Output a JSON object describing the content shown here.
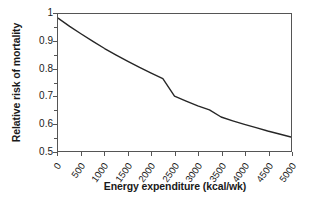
{
  "chart_data": {
    "type": "line",
    "title": "",
    "xlabel": "Energy expenditure (kcal/wk)",
    "ylabel": "Relative risk of mortality",
    "xlim": [
      0,
      5000
    ],
    "ylim": [
      0.5,
      1.0
    ],
    "grid": false,
    "legend": "none",
    "x_ticks": [
      "0",
      "500",
      "1000",
      "1500",
      "2000",
      "2500",
      "3000",
      "3500",
      "4000",
      "4500",
      "5000"
    ],
    "x_tick_values": [
      0,
      500,
      1000,
      1500,
      2000,
      2500,
      3000,
      3500,
      4000,
      4500,
      5000
    ],
    "y_ticks": [
      "1",
      "0.9",
      "0.8",
      "0.7",
      "0.6",
      "0.5"
    ],
    "y_tick_values": [
      1.0,
      0.9,
      0.8,
      0.7,
      0.6,
      0.5
    ],
    "y_minor_tick_values": [
      0.95,
      0.85,
      0.75,
      0.65,
      0.55
    ],
    "series": [
      {
        "name": "Relative risk of mortality",
        "color": "#262626",
        "line_width": 1.4,
        "x": [
          0,
          250,
          500,
          750,
          1000,
          1250,
          1500,
          1750,
          2000,
          2250,
          2500,
          2750,
          3000,
          3250,
          3500,
          3750,
          4000,
          4250,
          4500,
          4750,
          5000
        ],
        "values": [
          0.985,
          0.955,
          0.927,
          0.9,
          0.874,
          0.85,
          0.827,
          0.805,
          0.784,
          0.764,
          0.7,
          0.682,
          0.665,
          0.65,
          0.624,
          0.61,
          0.597,
          0.585,
          0.573,
          0.562,
          0.551
        ]
      }
    ]
  },
  "axes": {
    "x_title": "Energy expenditure (kcal/wk)",
    "y_title": "Relative risk of mortality"
  },
  "colors": {
    "curve": "#262626",
    "frame": "#555555",
    "text": "#1a1a1a",
    "background": "#ffffff"
  }
}
